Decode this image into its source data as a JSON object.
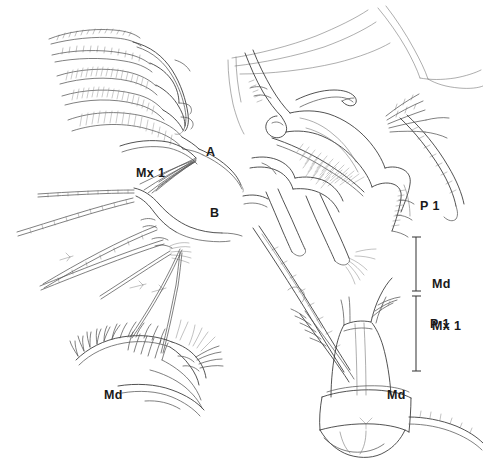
{
  "figure": {
    "domain": "scientific-illustration-plate",
    "background_color": "#ffffff",
    "ink_color": "#3a3a3a",
    "ink_color_dark": "#1a1a1a",
    "width": 483,
    "height": 469
  },
  "panel_labels": [
    {
      "id": "panel-a",
      "text": "A",
      "x": 206,
      "y": 146
    },
    {
      "id": "panel-b",
      "text": "B",
      "x": 210,
      "y": 207
    }
  ],
  "structure_labels": [
    {
      "id": "label-mx1-top-left",
      "text": "Mx 1",
      "x": 136,
      "y": 167
    },
    {
      "id": "label-p1-upper-right",
      "text": "P 1",
      "x": 420,
      "y": 200
    },
    {
      "id": "label-md-bottom-left",
      "text": "Md",
      "x": 104,
      "y": 389
    },
    {
      "id": "label-md-bottom-right",
      "text": "Md",
      "x": 387,
      "y": 389
    }
  ],
  "scale_bars": [
    {
      "id": "scale-bar-md-mx1",
      "label_line1": "Md",
      "label_line2": "Mx 1",
      "label_x": 432,
      "label_y": 249,
      "bar_x": 416,
      "bar_top": 237,
      "bar_bottom": 291,
      "cap_width": 9
    },
    {
      "id": "scale-bar-p1",
      "label_line1": "P 1",
      "label_line2": "",
      "label_x": 430,
      "label_y": 318,
      "bar_x": 416,
      "bar_top": 296,
      "bar_bottom": 371,
      "cap_width": 9
    }
  ],
  "specimens": [
    {
      "id": "specimen-mx1-a",
      "name": "Mx 1",
      "panel": "A",
      "position": "top-left"
    },
    {
      "id": "specimen-mx1-b",
      "name": "Mx 1",
      "panel": "B",
      "position": "mid-left"
    },
    {
      "id": "specimen-md-left",
      "name": "Md",
      "panel": "",
      "position": "bottom-left"
    },
    {
      "id": "specimen-p1",
      "name": "P 1",
      "panel": "",
      "position": "upper-right"
    },
    {
      "id": "specimen-md-right",
      "name": "Md",
      "panel": "",
      "position": "bottom-right"
    }
  ]
}
